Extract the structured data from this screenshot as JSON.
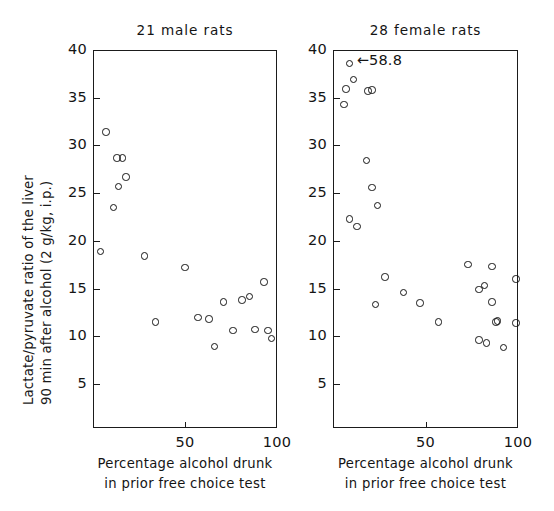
{
  "figure": {
    "ylabel_line1": "Lactate/pyruvate ratio of the liver",
    "ylabel_line2": "90 min after alcohol (2 g/kg, i.p.)",
    "ink_color": "#151515",
    "background_color": "#ffffff"
  },
  "chart_data": [
    {
      "type": "scatter",
      "panel_id": "male",
      "title": "21 male rats",
      "xlabel": "Percentage alcohol drunk in prior free choice test",
      "xlabel_line1": "Percentage alcohol drunk",
      "xlabel_line2": "in prior free choice test",
      "ylabel": "Lactate/pyruvate ratio of the liver 90 min after alcohol (2 g/kg, i.p.)",
      "xlim": [
        0,
        100
      ],
      "ylim": [
        0,
        40
      ],
      "xticks": [
        50,
        100
      ],
      "xticklabels": [
        "50",
        "100"
      ],
      "yticks": [
        5,
        10,
        15,
        20,
        25,
        30,
        35,
        40
      ],
      "yticklabels": [
        "5",
        "10",
        "15",
        "20",
        "25",
        "30",
        "35",
        "40"
      ],
      "grid": false,
      "legend": false,
      "n": 21,
      "marker": "open-circle",
      "x": [
        4,
        7,
        11,
        13,
        14,
        16,
        18,
        28,
        34,
        50,
        57,
        63,
        66,
        71,
        76,
        81,
        85,
        88,
        93,
        95,
        97
      ],
      "y": [
        18.9,
        31.4,
        23.5,
        28.7,
        25.7,
        28.7,
        26.7,
        18.4,
        11.5,
        17.2,
        12.0,
        11.8,
        8.9,
        13.6,
        10.6,
        13.8,
        14.2,
        10.7,
        15.7,
        10.6,
        9.8
      ]
    },
    {
      "type": "scatter",
      "panel_id": "female",
      "title": "28 female rats",
      "xlabel": "Percentage alcohol drunk in prior free choice test",
      "xlabel_line1": "Percentage alcohol drunk",
      "xlabel_line2": "in prior free choice test",
      "ylabel": "Lactate/pyruvate ratio of the liver 90 min after alcohol (2 g/kg, i.p.)",
      "xlim": [
        0,
        100
      ],
      "ylim": [
        0,
        40
      ],
      "xticks": [
        50,
        100
      ],
      "xticklabels": [
        "50",
        "100"
      ],
      "yticks": [
        5,
        10,
        15,
        20,
        25,
        30,
        35,
        40
      ],
      "yticklabels": [
        "5",
        "10",
        "15",
        "20",
        "25",
        "30",
        "35",
        "40"
      ],
      "grid": false,
      "legend": false,
      "n": 28,
      "marker": "open-circle",
      "annotation": {
        "text": "←58.8",
        "value": 58.8,
        "note": "off-scale point plotted at top of axis",
        "points_to_x": 9,
        "points_to_y": 38.6
      },
      "x": [
        9,
        11,
        7,
        19,
        21,
        6,
        18,
        21,
        24,
        9,
        13,
        23,
        28,
        38,
        47,
        57,
        73,
        79,
        82,
        79,
        83,
        86,
        86,
        88,
        89,
        92,
        99,
        99
      ],
      "y": [
        38.6,
        36.9,
        35.9,
        35.7,
        35.8,
        34.3,
        28.4,
        25.6,
        23.7,
        22.3,
        21.5,
        13.3,
        16.2,
        14.6,
        13.5,
        11.5,
        17.5,
        14.9,
        15.3,
        9.6,
        9.3,
        17.3,
        13.6,
        11.5,
        11.6,
        8.8,
        16.0,
        11.4
      ]
    }
  ]
}
